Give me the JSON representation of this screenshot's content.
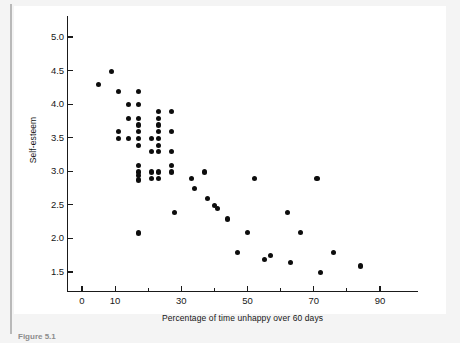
{
  "figure": {
    "caption": "Figure 5.1"
  },
  "chart_data": {
    "type": "scatter",
    "title": "",
    "xlabel": "Percentage of time unhappy over 60 days",
    "ylabel": "Self-esteem",
    "xlim": [
      -3,
      103
    ],
    "ylim": [
      1.25,
      5.2
    ],
    "grid": false,
    "legend": null,
    "xticks": [
      0,
      10,
      30,
      50,
      70,
      90
    ],
    "xtick_labels": [
      "0",
      "10",
      "30",
      "50",
      "70",
      "90"
    ],
    "x_minor_ticks": [
      20,
      40,
      60,
      80
    ],
    "yticks": [
      1.5,
      2.0,
      2.5,
      3.0,
      3.5,
      4.0,
      4.5,
      5.0
    ],
    "ytick_labels": [
      "1.5",
      "2.0",
      "2.5",
      "3.0",
      "3.5",
      "4.0",
      "4.5",
      "5.0"
    ],
    "marker_color": "#0d0d0d",
    "points": [
      [
        5,
        4.29
      ],
      [
        9,
        4.49
      ],
      [
        11,
        4.19
      ],
      [
        11,
        3.49
      ],
      [
        11,
        3.59
      ],
      [
        14,
        3.99
      ],
      [
        14,
        3.79
      ],
      [
        14,
        3.49
      ],
      [
        17,
        4.19
      ],
      [
        17,
        3.99
      ],
      [
        17,
        3.79
      ],
      [
        17,
        3.69
      ],
      [
        17,
        3.59
      ],
      [
        17,
        3.49
      ],
      [
        17,
        3.39
      ],
      [
        17,
        3.09
      ],
      [
        17,
        2.99
      ],
      [
        17,
        2.94
      ],
      [
        17,
        2.87
      ],
      [
        17,
        2.08
      ],
      [
        21,
        3.49
      ],
      [
        21,
        3.29
      ],
      [
        21,
        2.99
      ],
      [
        21,
        2.89
      ],
      [
        23,
        3.89
      ],
      [
        23,
        3.79
      ],
      [
        23,
        3.69
      ],
      [
        23,
        3.59
      ],
      [
        23,
        3.49
      ],
      [
        23,
        3.39
      ],
      [
        23,
        3.29
      ],
      [
        23,
        2.99
      ],
      [
        23,
        2.89
      ],
      [
        27,
        3.89
      ],
      [
        27,
        3.59
      ],
      [
        27,
        3.29
      ],
      [
        27,
        3.09
      ],
      [
        27,
        2.99
      ],
      [
        28,
        2.39
      ],
      [
        33,
        2.89
      ],
      [
        34,
        2.74
      ],
      [
        37,
        2.99
      ],
      [
        38,
        2.59
      ],
      [
        40,
        2.49
      ],
      [
        41,
        2.44
      ],
      [
        44,
        2.29
      ],
      [
        47,
        1.79
      ],
      [
        50,
        2.09
      ],
      [
        52,
        2.89
      ],
      [
        55,
        1.69
      ],
      [
        57,
        1.74
      ],
      [
        62,
        2.39
      ],
      [
        63,
        1.64
      ],
      [
        66,
        2.09
      ],
      [
        71,
        2.89
      ],
      [
        72,
        1.49
      ],
      [
        76,
        1.79
      ],
      [
        84,
        1.59
      ]
    ]
  }
}
